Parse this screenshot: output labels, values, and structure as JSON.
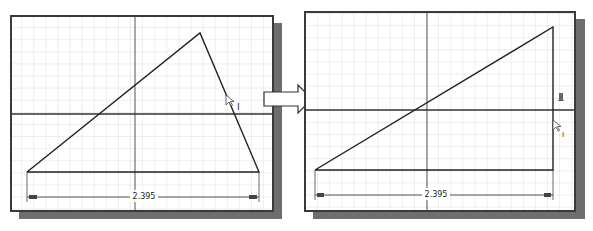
{
  "diagram": {
    "type": "before-after-sketch-constraint",
    "colors": {
      "grid_minor": "#d4d4d4",
      "axis": "#333333",
      "geometry": "#222222",
      "frame": "#3a3a3a",
      "shadow": "#6e6e6e",
      "background": "#ffffff"
    },
    "before": {
      "dimension_value": "2.395",
      "cursor_label": "I",
      "triangle_points": [
        [
          25,
          170
        ],
        [
          198,
          31
        ],
        [
          257,
          170
        ]
      ]
    },
    "transition_arrow": {
      "direction": "right"
    },
    "after": {
      "dimension_value": "2.395",
      "cursor_label": "I",
      "constraint_glyph": "perpendicular-icon",
      "triangle_points": [
        [
          313,
          168
        ],
        [
          551,
          25
        ],
        [
          551,
          168
        ]
      ]
    }
  }
}
